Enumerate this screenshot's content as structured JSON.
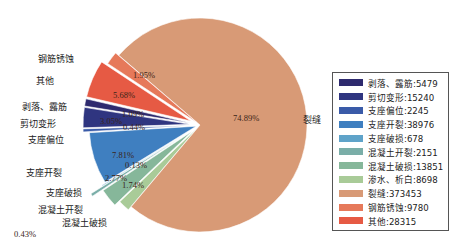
{
  "chart_data": {
    "type": "pie",
    "title": "",
    "exploded": true,
    "start_angle_deg": 220.6,
    "legend_position": "right",
    "slices": [
      {
        "name": "剥落、露筋",
        "value": 5479,
        "pct_label": "1.09%",
        "color": "#2e2a6e",
        "explode": 10,
        "outer_label": "剥落、露筋"
      },
      {
        "name": "剪切变形",
        "value": 15240,
        "pct_label": "3.05%",
        "color": "#2f3580",
        "explode": 10,
        "outer_label": "剪切变形"
      },
      {
        "name": "支座偏位",
        "value": 2245,
        "pct_label": "0.44%",
        "color": "#3a5ba8",
        "explode": 10,
        "outer_label": "支座偏位"
      },
      {
        "name": "支座开裂",
        "value": 38976,
        "pct_label": "7.81%",
        "color": "#3f7fc0",
        "explode": 4,
        "outer_label": "支座开裂"
      },
      {
        "name": "支座破损",
        "value": 678,
        "pct_label": "0.13%",
        "color": "#5fa3c9",
        "explode": 8,
        "outer_label": "支座破损"
      },
      {
        "name": "混凝土开裂",
        "value": 2151,
        "pct_label": "0.43%",
        "color": "#7aaea8",
        "explode": 22,
        "outer_label": "混凝土开裂"
      },
      {
        "name": "混凝土破损",
        "value": 13851,
        "pct_label": "2.77%",
        "color": "#86b79a",
        "explode": 10,
        "outer_label": "混凝土破损"
      },
      {
        "name": "渗水、析白",
        "value": 8698,
        "pct_label": "1.74%",
        "color": "#a9cb98",
        "explode": 4,
        "outer_label": "渗水、析白"
      },
      {
        "name": "裂缝",
        "value": 373453,
        "pct_label": "74.89%",
        "color": "#d89a76",
        "explode": 0,
        "outer_label": "裂缝"
      },
      {
        "name": "钢筋锈蚀",
        "value": 9780,
        "pct_label": "1.95%",
        "color": "#e6795a",
        "explode": 4,
        "outer_label": "钢筋锈蚀"
      },
      {
        "name": "其他",
        "value": 28315,
        "pct_label": "5.68%",
        "color": "#e65a44",
        "explode": 10,
        "outer_label": "其他"
      }
    ],
    "legend": [
      "剥落、露筋:5479",
      "剪切变形:15240",
      "支座偏位:2245",
      "支座开裂:38976",
      "支座破损:678",
      "混凝土开裂:2151",
      "混凝土破损:13851",
      "渗水、析白:8698",
      "裂缝:373453",
      "钢筋锈蚀:9780",
      "其他:28315"
    ]
  }
}
